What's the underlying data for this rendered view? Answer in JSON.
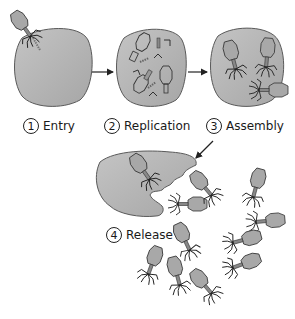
{
  "diagram": {
    "type": "phage-lifecycle",
    "colors": {
      "cell_fill": "#b4b4b4",
      "cell_stroke": "#5a5a5a",
      "phage_head": "#a8a8a8",
      "line": "#222222",
      "background": "#ffffff"
    },
    "steps": [
      {
        "number": "1",
        "label": "Entry"
      },
      {
        "number": "2",
        "label": "Replication"
      },
      {
        "number": "3",
        "label": "Assembly"
      },
      {
        "number": "4",
        "label": "Release"
      }
    ]
  }
}
